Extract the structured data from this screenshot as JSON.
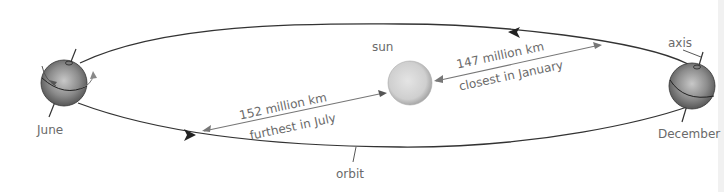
{
  "diagram": {
    "labels": {
      "sun": "sun",
      "axis": "axis",
      "orbit": "orbit",
      "june": "June",
      "december": "December",
      "far_distance": "152 million km",
      "far_caption": "furthest in July",
      "near_distance": "147 million km",
      "near_caption": "closest in January"
    },
    "colors": {
      "orbit_line": "#333333",
      "distance_line": "#777777",
      "label_text": "#6a6a6a",
      "sun_fill": "#cfcfcf",
      "earth_fill": "#8a8a8a"
    }
  }
}
